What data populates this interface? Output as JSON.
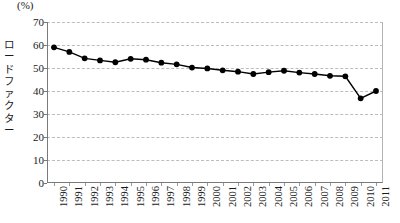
{
  "chart_data": {
    "type": "line",
    "title": "",
    "xlabel": "",
    "ylabel": "ロードファクター",
    "unit_label": "(%)",
    "ylim": [
      0,
      70
    ],
    "ytick_step": 10,
    "yticks": [
      0,
      10,
      20,
      30,
      40,
      50,
      60,
      70
    ],
    "grid": true,
    "legend": "none",
    "marker": "filled-circle",
    "line_color": "#000000",
    "marker_color": "#000000",
    "grid_color": "#bdbdbd",
    "axis_color": "#7a7a7a",
    "categories": [
      "1990",
      "1991",
      "1992",
      "1993",
      "1994",
      "1995",
      "1996",
      "1997",
      "1998",
      "1999",
      "2000",
      "2001",
      "2002",
      "2003",
      "2004",
      "2005",
      "2006",
      "2007",
      "2008",
      "2009",
      "2010",
      "2011"
    ],
    "values": [
      59,
      57,
      54.2,
      53.3,
      52.5,
      54,
      53.6,
      52.3,
      51.6,
      50.2,
      49.8,
      49,
      48.4,
      47.4,
      48.2,
      48.8,
      48,
      47.4,
      46.6,
      46.4,
      36.8,
      40
    ]
  }
}
